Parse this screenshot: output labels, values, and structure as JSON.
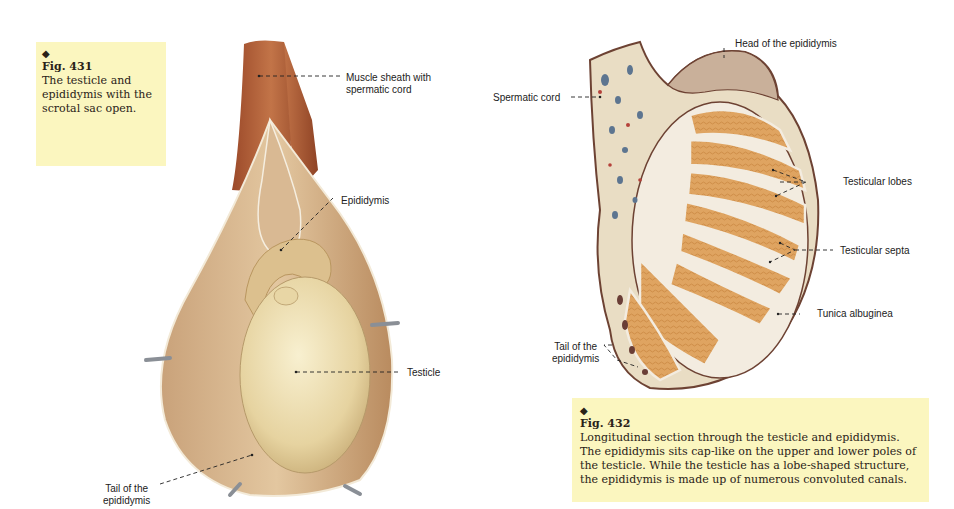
{
  "figure_431": {
    "marker": "◆",
    "number": "Fig. 431",
    "caption": "The testicle and epididymis with the scrotal sac open.",
    "labels": {
      "muscle_sheath_line1": "Muscle sheath with",
      "muscle_sheath_line2": "spermatic cord",
      "epididymis": "Epididymis",
      "testicle": "Testicle",
      "tail_line1": "Tail of the",
      "tail_line2": "epididymis"
    }
  },
  "figure_432": {
    "marker": "◆",
    "number": "Fig. 432",
    "caption": "Longitudinal section through the testicle and epididymis. The epididymis sits cap-like on the upper and lower poles of the testicle. While the testicle has a lobe-shaped structure, the epididymis is made up of numerous convoluted canals.",
    "labels": {
      "head_of_epididymis": "Head of the epididymis",
      "spermatic_cord": "Spermatic cord",
      "testicular_lobes": "Testicular lobes",
      "testicular_septa": "Testicular septa",
      "tunica_albuginea": "Tunica albuginea",
      "tail_line1": "Tail of the",
      "tail_line2": "epididymis"
    }
  },
  "colors": {
    "caption_bg": "#fbf6bf",
    "muscle": "#b5623b",
    "sac": "#d8b48a",
    "testicle": "#ecdcae",
    "lobe": "#e0a865",
    "capsule": "#7a4a3a"
  }
}
